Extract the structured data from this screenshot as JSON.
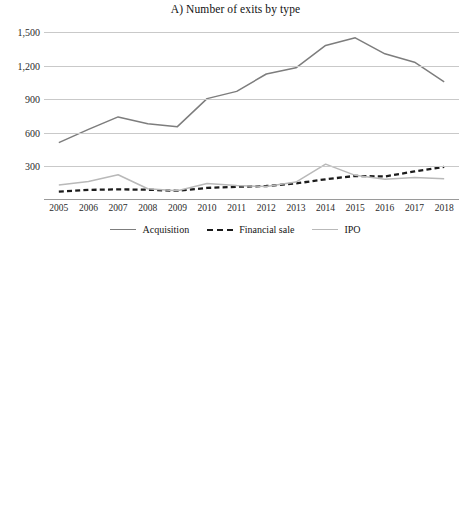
{
  "figure": {
    "panel_a_title": "A) Number of exits by type",
    "panel_b_title": "B) Value of exits by type"
  },
  "legend_a": {
    "items": [
      {
        "label": "Acquisition",
        "style": "solid",
        "color": "#7d7d7d"
      },
      {
        "label": "Financial sale",
        "style": "dashed",
        "color": "#1c1c1c"
      },
      {
        "label": "IPO",
        "style": "solid",
        "color": "#b9b9b9"
      }
    ]
  },
  "legend_b": {
    "items": [
      {
        "label": "Acquisition",
        "color": "#8a8a8a"
      },
      {
        "label": "Financial sale",
        "color": "#3a3a3a"
      },
      {
        "label": "IPO",
        "color": "#c4c4c4"
      }
    ]
  },
  "chart_data": [
    {
      "type": "line",
      "title": "A) Number of exits by type",
      "xlabel": "",
      "ylabel": "",
      "x": [
        "2005",
        "2006",
        "2007",
        "2008",
        "2009",
        "2010",
        "2011",
        "2012",
        "2013",
        "2014",
        "2015",
        "2016",
        "2017",
        "2018"
      ],
      "ylim": [
        0,
        1500
      ],
      "yticks": [
        300,
        600,
        900,
        1200,
        1500
      ],
      "ytick_labels": [
        "300",
        "600",
        "900",
        "1,200",
        "1,500"
      ],
      "grid": true,
      "legend_position": "bottom",
      "series": [
        {
          "name": "Acquisition",
          "color": "#7d7d7d",
          "style": "solid",
          "values": [
            512,
            630,
            742,
            680,
            655,
            905,
            970,
            1125,
            1180,
            1380,
            1448,
            1305,
            1230,
            1055
          ]
        },
        {
          "name": "Financial sale",
          "color": "#1c1c1c",
          "style": "dashed",
          "values": [
            75,
            90,
            95,
            92,
            82,
            108,
            118,
            125,
            148,
            185,
            215,
            210,
            255,
            295
          ]
        },
        {
          "name": "IPO",
          "color": "#b9b9b9",
          "style": "solid",
          "values": [
            135,
            165,
            225,
            100,
            82,
            148,
            130,
            120,
            160,
            320,
            220,
            185,
            200,
            190
          ]
        }
      ]
    },
    {
      "type": "bar",
      "subtype": "stacked",
      "title": "B) Value of exits by type",
      "xlabel": "",
      "ylabel": "",
      "categories": [
        "2005",
        "2006",
        "2007",
        "2008",
        "2009",
        "2010",
        "2011",
        "2012",
        "2013",
        "2014",
        "2015",
        "2016",
        "2017",
        "2018"
      ],
      "ylim": [
        0,
        380
      ],
      "yticks": [
        30,
        80,
        130,
        180,
        230,
        280,
        330,
        380
      ],
      "ytick_labels": [
        "30",
        "80",
        "130",
        "180",
        "230",
        "280",
        "330",
        "380"
      ],
      "grid": true,
      "legend_position": "bottom",
      "series": [
        {
          "name": "Acquisition",
          "color": "#8a8a8a",
          "values": [
            18,
            27,
            40,
            21,
            20,
            36,
            41,
            37,
            53,
            82,
            62,
            73,
            56,
            97
          ]
        },
        {
          "name": "Financial sale",
          "color": "#3a3a3a",
          "values": [
            4,
            3,
            5,
            2,
            2,
            4,
            4,
            4,
            5,
            6,
            5,
            5,
            5,
            7
          ]
        },
        {
          "name": "IPO",
          "color": "#c4c4c4",
          "values": [
            13,
            14,
            39,
            2,
            3,
            22,
            50,
            88,
            44,
            140,
            47,
            27,
            83,
            254
          ]
        }
      ],
      "totals": [
        35,
        44,
        84,
        25,
        25,
        62,
        95,
        129,
        102,
        228,
        114,
        105,
        144,
        358
      ]
    }
  ]
}
